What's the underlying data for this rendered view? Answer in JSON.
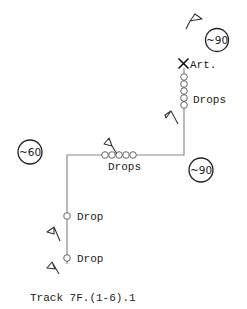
{
  "diagram": {
    "title": "Track 7F.(1-6).1",
    "track_color": "#8a8a8a",
    "speed_limits": [
      {
        "label": "~90",
        "position": "top-right"
      },
      {
        "label": "~60",
        "position": "left"
      },
      {
        "label": "~90",
        "position": "right-bend"
      }
    ],
    "markers": {
      "artifact": {
        "icon": "x-cross-icon",
        "label": "Art."
      },
      "drop_groups": [
        {
          "label": "Drops",
          "count": 5,
          "segment": "upper-vertical"
        },
        {
          "label": "Drops",
          "count": 5,
          "segment": "horizontal"
        },
        {
          "label": "Drop",
          "count": 1,
          "segment": "lower-vertical-1"
        },
        {
          "label": "Drop",
          "count": 1,
          "segment": "lower-vertical-2"
        }
      ]
    },
    "flags": [
      {
        "icon": "flag-icon",
        "location": "top"
      },
      {
        "icon": "flag-icon",
        "location": "upper-vertical"
      },
      {
        "icon": "flag-icon",
        "location": "horizontal"
      },
      {
        "icon": "flag-icon",
        "location": "lower-1"
      },
      {
        "icon": "flag-icon",
        "location": "lower-2"
      }
    ]
  }
}
